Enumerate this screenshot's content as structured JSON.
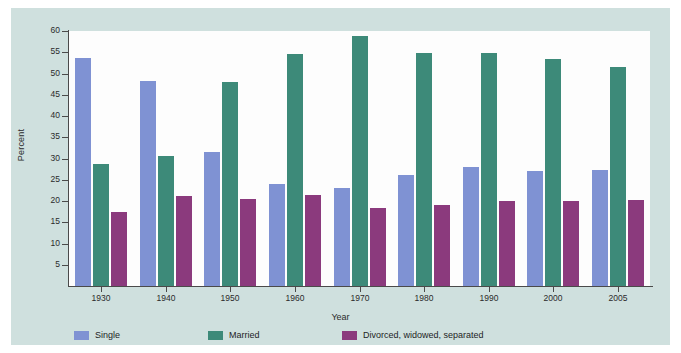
{
  "chart_data": {
    "type": "bar",
    "title": "",
    "xlabel": "Year",
    "ylabel": "Percent",
    "categories": [
      "1930",
      "1940",
      "1950",
      "1960",
      "1970",
      "1980",
      "1990",
      "2000",
      "2005"
    ],
    "series": [
      {
        "name": "Single",
        "color": "#7f92d3",
        "values": [
          53.7,
          48.3,
          31.6,
          23.9,
          23.0,
          26.1,
          28.0,
          27.1,
          27.3
        ]
      },
      {
        "name": "Married",
        "color": "#3d8a79",
        "values": [
          28.8,
          30.5,
          47.9,
          54.5,
          58.8,
          54.9,
          54.8,
          53.4,
          51.6
        ]
      },
      {
        "name": "Divorced, widowed, separated",
        "color": "#8b3a7d",
        "values": [
          17.3,
          21.2,
          20.5,
          21.5,
          18.3,
          19.0,
          20.1,
          20.1,
          20.3
        ]
      }
    ],
    "ylim": [
      0,
      60
    ],
    "yticks": [
      5,
      10,
      15,
      20,
      25,
      30,
      35,
      40,
      45,
      50,
      55,
      60
    ],
    "ytick_labels": [
      "5",
      "10",
      "15",
      "20",
      "25",
      "30",
      "35",
      "40",
      "45",
      "50",
      "55",
      "60"
    ],
    "grid": false,
    "legend_position": "bottom-left",
    "legend": [
      "Single",
      "Married",
      "Divorced, widowed, separated"
    ],
    "colors": {
      "panel_background": "#cfe0de",
      "plot_background": "#fdfdfd",
      "axis": "#4a4a4a",
      "single": "#7f92d3",
      "married": "#3d8a79",
      "divorced": "#8b3a7d"
    }
  }
}
